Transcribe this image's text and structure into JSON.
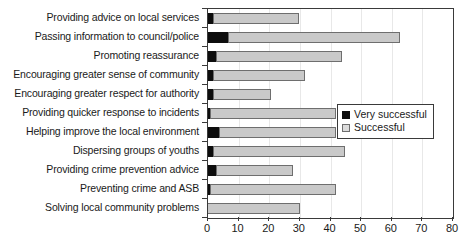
{
  "chart_data": {
    "type": "bar",
    "orientation": "horizontal",
    "stacked": true,
    "title": "",
    "xlabel": "",
    "ylabel": "",
    "xlim": [
      0,
      80
    ],
    "xticks": [
      0,
      10,
      20,
      30,
      40,
      50,
      60,
      70,
      80
    ],
    "grid": true,
    "legend_position": "center-right",
    "categories": [
      "Providing advice on local services",
      "Passing information to council/police",
      "Promoting reassurance",
      "Encouraging greater sense of community",
      "Encouraging greater respect for authority",
      "Providing quicker response to incidents",
      "Helping improve the local environment",
      "Dispersing groups of youths",
      "Providing crime prevention advice",
      "Preventing crime and ASB",
      "Solving local community problems"
    ],
    "series": [
      {
        "name": "Very successful",
        "color": "#0d0d0d",
        "values": [
          2,
          7,
          3,
          2,
          2,
          1,
          4,
          2,
          3,
          1,
          0
        ]
      },
      {
        "name": "Successful",
        "color": "#c9c9c9",
        "values": [
          28,
          56,
          41,
          30,
          19,
          41,
          38,
          43,
          25,
          41,
          30
        ]
      }
    ],
    "totals": [
      30,
      63,
      44,
      32,
      21,
      42,
      42,
      45,
      28,
      42,
      30
    ]
  },
  "legend": {
    "items": [
      {
        "label": "Very successful",
        "swatch": "black-square-swatch"
      },
      {
        "label": "Successful",
        "swatch": "light-gray-square-swatch"
      }
    ]
  },
  "axis": {
    "x_tick_labels": [
      "0",
      "10",
      "20",
      "30",
      "40",
      "50",
      "60",
      "70",
      "80"
    ]
  }
}
